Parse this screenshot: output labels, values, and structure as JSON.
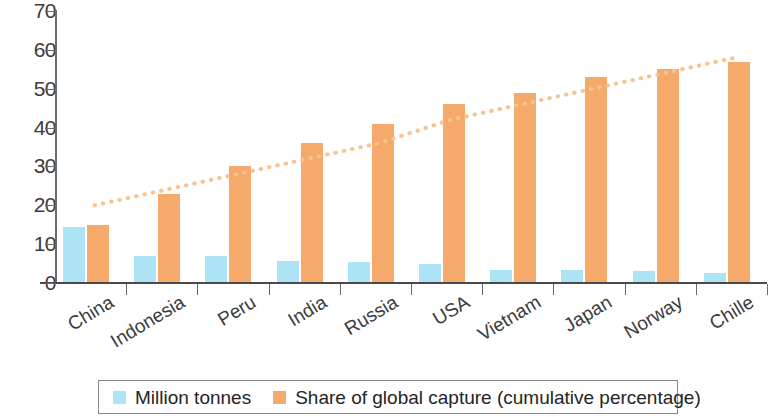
{
  "chart_data": {
    "type": "bar",
    "title": "",
    "subtitle": "",
    "xlabel": "",
    "ylabel": "",
    "ylim": [
      0,
      70
    ],
    "ytick_step": 10,
    "yticks": [
      "0",
      "10",
      "20",
      "30",
      "40",
      "50",
      "60",
      "70"
    ],
    "grid": false,
    "legend_position": "bottom",
    "categories": [
      "China",
      "Indonesia",
      "Peru",
      "India",
      "Russia",
      "USA",
      "Vietnam",
      "Japan",
      "Norway",
      "Chille"
    ],
    "series": [
      {
        "name": "Million tonnes",
        "color": "#ace4f5",
        "values": [
          14.5,
          7,
          7,
          5.6,
          5.3,
          5,
          3.4,
          3.3,
          3,
          2.5
        ]
      },
      {
        "name": "Share of global capture (cumulative percentage)",
        "color": "#f5a96a",
        "values": [
          15,
          23,
          30,
          36,
          41,
          46,
          49,
          53,
          55,
          57
        ]
      }
    ],
    "annotations": [
      {
        "name": "trend-dotted-line",
        "style": "dotted",
        "color": "#f6c391",
        "points": [
          20,
          24,
          28,
          32,
          36,
          42,
          46,
          50,
          54,
          58
        ]
      }
    ]
  },
  "legend": {
    "items": [
      {
        "label": "Million tonnes",
        "color": "#ace4f5"
      },
      {
        "label": "Share of global capture (cumulative percentage)",
        "color": "#f5a96a"
      }
    ]
  }
}
